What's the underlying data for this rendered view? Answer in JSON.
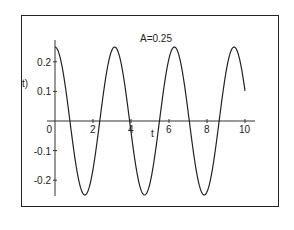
{
  "chart_data": {
    "type": "line",
    "title": "A=0.25",
    "xlabel": "t",
    "ylabel": "t)",
    "xlim": [
      0,
      10
    ],
    "ylim": [
      -0.27,
      0.27
    ],
    "x_ticks": [
      "2",
      "4",
      "6",
      "8",
      "10"
    ],
    "y_ticks": [
      "0.2",
      "0.1",
      "0",
      "-0.1",
      "-0.2"
    ],
    "grid": false,
    "legend": null,
    "function": "0.25*cos(2t)",
    "series": [
      {
        "name": "A=0.25",
        "x": [
          0,
          0.5,
          1,
          1.5,
          2,
          2.5,
          3,
          3.5,
          4,
          4.5,
          5,
          5.5,
          6,
          6.5,
          7,
          7.5,
          8,
          8.5,
          9,
          9.5,
          10
        ],
        "values": [
          0.25,
          0.135,
          -0.104,
          -0.247,
          -0.163,
          0.071,
          0.24,
          0.188,
          -0.036,
          -0.228,
          -0.21,
          0.0,
          0.211,
          0.228,
          0.034,
          -0.19,
          -0.239,
          -0.069,
          0.165,
          0.247,
          0.102
        ]
      }
    ]
  }
}
